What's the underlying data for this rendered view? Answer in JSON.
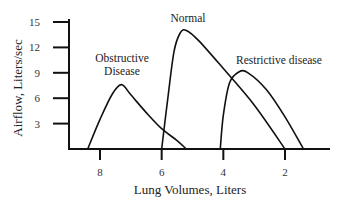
{
  "chart_data": {
    "type": "line",
    "title": "",
    "xlabel": "Lung Volumes, Liters",
    "ylabel": "Airflow, Liters/sec",
    "x_axis_reversed": true,
    "xlim": [
      9.0,
      1.0
    ],
    "ylim": [
      0,
      15
    ],
    "x_ticks": [
      8,
      6,
      4,
      2
    ],
    "y_ticks": [
      3,
      6,
      9,
      12,
      15
    ],
    "grid": false,
    "legend": null,
    "series": [
      {
        "name": "Obstructive Disease",
        "label_lines": [
          "Obstructive",
          "Disease"
        ],
        "points": [
          [
            8.4,
            0
          ],
          [
            8.0,
            3.5
          ],
          [
            7.6,
            6.5
          ],
          [
            7.3,
            7.6
          ],
          [
            7.0,
            6.4
          ],
          [
            6.5,
            4.3
          ],
          [
            6.0,
            2.4
          ],
          [
            5.5,
            1.0
          ],
          [
            5.2,
            0
          ]
        ]
      },
      {
        "name": "Normal",
        "label_lines": [
          "Normal"
        ],
        "points": [
          [
            6.0,
            0
          ],
          [
            5.8,
            6.0
          ],
          [
            5.6,
            11.5
          ],
          [
            5.4,
            13.7
          ],
          [
            5.2,
            14.0
          ],
          [
            4.8,
            12.8
          ],
          [
            4.0,
            9.5
          ],
          [
            3.0,
            5.2
          ],
          [
            2.0,
            0
          ]
        ]
      },
      {
        "name": "Restrictive disease",
        "label_lines": [
          "Restrictive disease"
        ],
        "points": [
          [
            4.1,
            0
          ],
          [
            4.0,
            4.0
          ],
          [
            3.8,
            7.8
          ],
          [
            3.5,
            9.1
          ],
          [
            3.2,
            9.0
          ],
          [
            2.6,
            7.0
          ],
          [
            2.0,
            3.8
          ],
          [
            1.4,
            0
          ]
        ]
      }
    ]
  }
}
